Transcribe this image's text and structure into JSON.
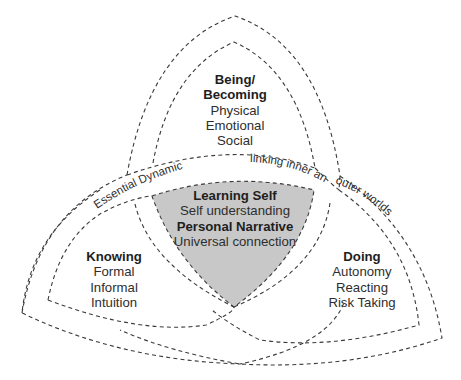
{
  "diagram": {
    "type": "three-petal overlapping dashed-outline diagram",
    "colors": {
      "background": "#ffffff",
      "outline": "#3a3a3a",
      "center_fill": "#c8c8c8",
      "text": "#2e2e2e"
    },
    "being": {
      "title_line1": "Being/",
      "title_line2": "Becoming",
      "items": [
        "Physical",
        "Emotional",
        "Social"
      ]
    },
    "knowing": {
      "title": "Knowing",
      "items": [
        "Formal",
        "Informal",
        "Intuition"
      ]
    },
    "doing": {
      "title": "Doing",
      "items": [
        "Autonomy",
        "Reacting",
        "Risk Taking"
      ]
    },
    "center": {
      "title": "Learning Self",
      "line2": "Self understanding",
      "line3": "Personal Narrative",
      "line4": "Universal connection"
    },
    "band": {
      "segment1": "Essential Dynamic",
      "segment2": "linking inner and",
      "segment3": "outer worlds"
    }
  }
}
